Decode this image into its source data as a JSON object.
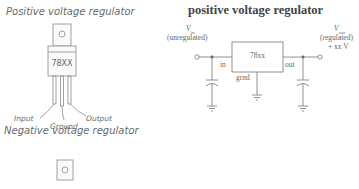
{
  "left_panel": {
    "positive_title": "Positive voltage regulator",
    "negative_title": "Negative voltage regulator",
    "package": {
      "part_label": "78XX",
      "pins": [
        "Input",
        "Ground",
        "Output"
      ]
    }
  },
  "schematic": {
    "title": "positive voltage regulator",
    "vin_label": "V",
    "vin_sub": "in",
    "vin_note": "(unregulated)",
    "vout_label": "V",
    "vout_sub": "out",
    "vout_note": "(regulated)",
    "vout_value": "+ xx V",
    "chip_label": "78xx",
    "pin_in": "in",
    "pin_out": "out",
    "pin_gnd": "grnd"
  }
}
